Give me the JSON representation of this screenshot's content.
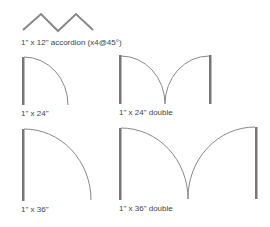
{
  "colors": {
    "background": "#ffffff",
    "stroke": "#888888",
    "jamb": "#777777",
    "text": "#444444"
  },
  "symbols": [
    {
      "id": "accordion",
      "label": "1\" x 12\" accordion (x4@45°)"
    },
    {
      "id": "door-24",
      "label": "1\" x 24\""
    },
    {
      "id": "door-24-double",
      "label": "1\" x 24\" double"
    },
    {
      "id": "door-36",
      "label": "1\" x 36\""
    },
    {
      "id": "door-36-double",
      "label": "1\" x 36\" double"
    }
  ]
}
